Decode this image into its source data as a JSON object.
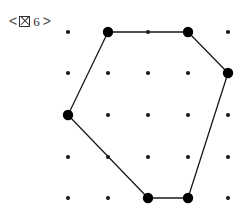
{
  "figure": {
    "caption": {
      "open_bracket": "<",
      "close_bracket": ">",
      "missing_glyph": "図",
      "number": "6",
      "full_text": "< 図 6 >"
    },
    "background_color": "#ffffff",
    "ink_color": "#1a1a1a"
  },
  "chart_data": {
    "type": "scatter",
    "subtitle": "",
    "xlabel": "",
    "ylabel": "",
    "grid": false,
    "legend": null,
    "xlim": [
      0,
      4
    ],
    "ylim": [
      0,
      4
    ],
    "grid_spec": {
      "columns": 5,
      "rows": 5,
      "x_pixels": [
        68,
        108,
        148,
        188,
        228
      ],
      "y_pixels": [
        32,
        73,
        115,
        157,
        198
      ],
      "x_spacing_px": 40,
      "y_spacing_px": 41.5,
      "small_dot_radius_px": 2.1,
      "large_dot_radius_px": 5.2
    },
    "points": [
      {
        "col": 0,
        "row": 0,
        "x": 68,
        "y": 32,
        "size": "small",
        "vertex": false
      },
      {
        "col": 1,
        "row": 0,
        "x": 108,
        "y": 32,
        "size": "large",
        "vertex": true
      },
      {
        "col": 2,
        "row": 0,
        "x": 148,
        "y": 32,
        "size": "small",
        "vertex": false
      },
      {
        "col": 3,
        "row": 0,
        "x": 188,
        "y": 32,
        "size": "large",
        "vertex": true
      },
      {
        "col": 4,
        "row": 0,
        "x": 228,
        "y": 32,
        "size": "small",
        "vertex": false
      },
      {
        "col": 0,
        "row": 1,
        "x": 68,
        "y": 73,
        "size": "small",
        "vertex": false
      },
      {
        "col": 1,
        "row": 1,
        "x": 108,
        "y": 73,
        "size": "small",
        "vertex": false
      },
      {
        "col": 2,
        "row": 1,
        "x": 148,
        "y": 73,
        "size": "small",
        "vertex": false
      },
      {
        "col": 3,
        "row": 1,
        "x": 188,
        "y": 73,
        "size": "small",
        "vertex": false
      },
      {
        "col": 4,
        "row": 1,
        "x": 228,
        "y": 73,
        "size": "large",
        "vertex": true
      },
      {
        "col": 0,
        "row": 2,
        "x": 68,
        "y": 115,
        "size": "large",
        "vertex": true
      },
      {
        "col": 1,
        "row": 2,
        "x": 108,
        "y": 115,
        "size": "small",
        "vertex": false
      },
      {
        "col": 2,
        "row": 2,
        "x": 148,
        "y": 115,
        "size": "small",
        "vertex": false
      },
      {
        "col": 3,
        "row": 2,
        "x": 188,
        "y": 115,
        "size": "small",
        "vertex": false
      },
      {
        "col": 4,
        "row": 2,
        "x": 228,
        "y": 115,
        "size": "small",
        "vertex": false
      },
      {
        "col": 0,
        "row": 3,
        "x": 68,
        "y": 157,
        "size": "small",
        "vertex": false
      },
      {
        "col": 1,
        "row": 3,
        "x": 108,
        "y": 157,
        "size": "small",
        "vertex": false
      },
      {
        "col": 2,
        "row": 3,
        "x": 148,
        "y": 157,
        "size": "small",
        "vertex": false
      },
      {
        "col": 3,
        "row": 3,
        "x": 188,
        "y": 157,
        "size": "small",
        "vertex": false
      },
      {
        "col": 4,
        "row": 3,
        "x": 228,
        "y": 157,
        "size": "small",
        "vertex": false
      },
      {
        "col": 0,
        "row": 4,
        "x": 68,
        "y": 198,
        "size": "small",
        "vertex": false
      },
      {
        "col": 1,
        "row": 4,
        "x": 108,
        "y": 198,
        "size": "small",
        "vertex": false
      },
      {
        "col": 2,
        "row": 4,
        "x": 148,
        "y": 198,
        "size": "large",
        "vertex": true
      },
      {
        "col": 3,
        "row": 4,
        "x": 188,
        "y": 198,
        "size": "large",
        "vertex": true
      },
      {
        "col": 4,
        "row": 4,
        "x": 228,
        "y": 198,
        "size": "small",
        "vertex": false
      }
    ],
    "polygon": {
      "name": "hexagon",
      "closed": true,
      "sides": 6,
      "stroke_width_px": 1.3,
      "stroke_color": "#1a1a1a",
      "fill": "none",
      "vertices": [
        {
          "label": "A",
          "col": 1,
          "row": 0,
          "x": 108,
          "y": 32
        },
        {
          "label": "B",
          "col": 3,
          "row": 0,
          "x": 188,
          "y": 32
        },
        {
          "label": "C",
          "col": 4,
          "row": 1,
          "x": 228,
          "y": 73
        },
        {
          "label": "D",
          "col": 3,
          "row": 4,
          "x": 188,
          "y": 198
        },
        {
          "label": "E",
          "col": 2,
          "row": 4,
          "x": 148,
          "y": 198
        },
        {
          "label": "F",
          "col": 0,
          "row": 2,
          "x": 68,
          "y": 115
        }
      ],
      "edges": [
        {
          "from": "A",
          "to": "B"
        },
        {
          "from": "B",
          "to": "C"
        },
        {
          "from": "C",
          "to": "D"
        },
        {
          "from": "D",
          "to": "E"
        },
        {
          "from": "E",
          "to": "F"
        },
        {
          "from": "F",
          "to": "A"
        }
      ]
    }
  }
}
